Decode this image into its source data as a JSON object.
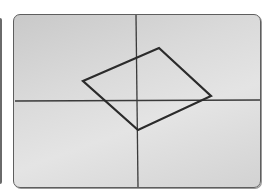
{
  "figure": {
    "type": "coordinate-plane-diagram",
    "panel": {
      "background": "#d8d8d8",
      "border_color": "#5e5e5e"
    },
    "axes": {
      "color": "#3a3a3a",
      "origin_px": [
        136,
        100
      ],
      "x_axis": {
        "from": [
          14,
          100
        ],
        "to": [
          259,
          99
        ]
      },
      "y_axis": {
        "from": [
          135,
          14
        ],
        "to": [
          137,
          186
        ]
      }
    },
    "shape": {
      "name": "parallelogram",
      "stroke_color": "#2b2b2b",
      "vertices_px": [
        [
          82,
          80
        ],
        [
          158,
          47
        ],
        [
          210,
          95
        ],
        [
          137,
          129
        ]
      ]
    }
  }
}
